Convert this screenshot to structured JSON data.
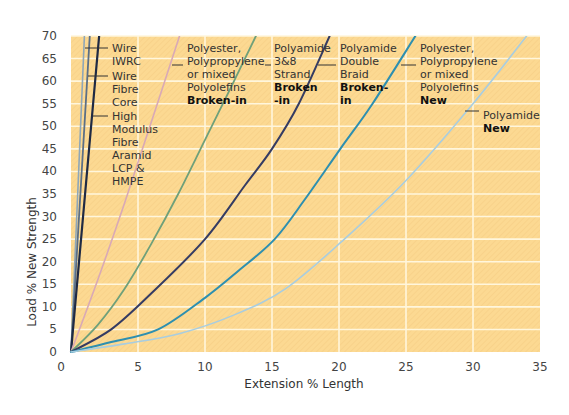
{
  "chart_data": {
    "type": "line",
    "title": "",
    "xlabel": "Extension % Length",
    "ylabel": "Load % New Strength",
    "xlim": [
      0,
      35
    ],
    "ylim": [
      0,
      70
    ],
    "x_ticks": [
      0,
      5,
      10,
      15,
      20,
      25,
      30,
      35
    ],
    "y_ticks": [
      0,
      5,
      10,
      15,
      20,
      25,
      30,
      35,
      40,
      45,
      50,
      55,
      60,
      65,
      70
    ],
    "grid": true,
    "background_color": "#fcd992",
    "grid_color": "#fff6dc",
    "legend_position": "inline annotations",
    "series": [
      {
        "name": "Wire IWRC",
        "color": "#8fa7b8",
        "width": 1.6,
        "points": [
          [
            0,
            0
          ],
          [
            1.0,
            70
          ]
        ]
      },
      {
        "name": "Wire Fibre Core",
        "color": "#5b6f86",
        "width": 1.8,
        "points": [
          [
            0,
            0
          ],
          [
            1.4,
            70
          ]
        ]
      },
      {
        "name": "High Modulus Fibre Aramid LCP & HMPE",
        "color": "#1f2a44",
        "width": 2.2,
        "points": [
          [
            0,
            0
          ],
          [
            2.1,
            70
          ]
        ]
      },
      {
        "name": "Polyester, Polypropylene or mixed Polyolefins Broken-in",
        "color": "#d9a9b6",
        "width": 1.6,
        "points": [
          [
            0,
            0
          ],
          [
            2,
            16
          ],
          [
            4,
            33
          ],
          [
            6,
            51
          ],
          [
            8.1,
            70
          ]
        ]
      },
      {
        "name": "Polyamide 3&8 Strand Broken-in",
        "color": "#6fa07a",
        "width": 1.8,
        "points": [
          [
            0,
            0
          ],
          [
            2,
            6
          ],
          [
            4,
            14
          ],
          [
            6,
            24
          ],
          [
            8,
            35
          ],
          [
            10,
            47
          ],
          [
            12,
            59
          ],
          [
            13.8,
            70
          ]
        ]
      },
      {
        "name": "Polyamide Double Braid Broken-in",
        "color": "#353c63",
        "width": 2.0,
        "points": [
          [
            0,
            0
          ],
          [
            3,
            5
          ],
          [
            6,
            13
          ],
          [
            10,
            25
          ],
          [
            13,
            37
          ],
          [
            15,
            45
          ],
          [
            17,
            55
          ],
          [
            19.3,
            70
          ]
        ]
      },
      {
        "name": "Polyester, Polypropylene or mixed Polyolefins New",
        "color": "#2d8fb0",
        "width": 2.0,
        "points": [
          [
            0,
            0
          ],
          [
            3,
            2.2
          ],
          [
            6.5,
            5
          ],
          [
            10,
            12
          ],
          [
            12.5,
            18
          ],
          [
            15.2,
            25
          ],
          [
            17.5,
            34
          ],
          [
            20.1,
            45
          ],
          [
            22.5,
            55
          ],
          [
            25.7,
            70
          ]
        ]
      },
      {
        "name": "Polyamide New",
        "color": "#a8cde0",
        "width": 1.6,
        "points": [
          [
            0,
            0
          ],
          [
            4,
            1.8
          ],
          [
            8,
            4
          ],
          [
            12,
            8
          ],
          [
            16,
            14
          ],
          [
            20.4,
            25
          ],
          [
            25,
            38
          ],
          [
            30,
            55
          ],
          [
            34,
            70
          ]
        ]
      }
    ],
    "annotations": [
      {
        "lines": [
          "Wire",
          "IWRC"
        ],
        "bold": [],
        "x": 112,
        "y": 48,
        "leader": [
          [
            85,
            48
          ],
          [
            108,
            48
          ]
        ]
      },
      {
        "lines": [
          "Wire",
          "Fibre",
          "Core"
        ],
        "bold": [],
        "x": 112,
        "y": 76,
        "leader": [
          [
            88,
            76
          ],
          [
            108,
            76
          ]
        ]
      },
      {
        "lines": [
          "High",
          "Modulus",
          "Fibre",
          "Aramid",
          "LCP &",
          "HMPE"
        ],
        "bold": [],
        "x": 112,
        "y": 116,
        "leader": [
          [
            93,
            116
          ],
          [
            108,
            116
          ]
        ]
      },
      {
        "lines": [
          "Polyester,",
          "Polypropylene",
          "or mixed",
          "Polyolefins",
          "Broken-in"
        ],
        "bold": [
          4
        ],
        "x": 187,
        "y": 48,
        "leader": [
          [
            172,
            65
          ],
          [
            183,
            65
          ]
        ]
      },
      {
        "lines": [
          "Polyamide",
          "3&8",
          "Strand",
          "Broken",
          "-in"
        ],
        "bold": [
          3,
          4
        ],
        "x": 274,
        "y": 48,
        "leader": [
          [
            265,
            65
          ],
          [
            271,
            65
          ]
        ]
      },
      {
        "lines": [
          "Polyamide",
          "Double",
          "Braid",
          "Broken-",
          "in"
        ],
        "bold": [
          3,
          4
        ],
        "x": 340,
        "y": 48,
        "leader": [
          [
            318,
            65
          ],
          [
            336,
            65
          ]
        ]
      },
      {
        "lines": [
          "Polyester,",
          "Polypropylene",
          "or mixed",
          "Polyolefins",
          "New"
        ],
        "bold": [
          4
        ],
        "x": 420,
        "y": 48,
        "leader": [
          [
            401,
            65
          ],
          [
            416,
            65
          ]
        ]
      },
      {
        "lines": [
          "Polyamide",
          "New"
        ],
        "bold": [
          1
        ],
        "x": 483,
        "y": 115,
        "leader": [
          [
            465,
            111
          ],
          [
            479,
            111
          ]
        ]
      }
    ]
  }
}
